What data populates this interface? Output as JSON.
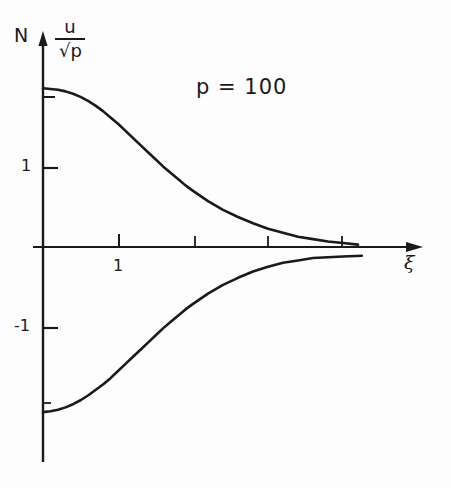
{
  "figure": {
    "background_color": "#fdfdfd",
    "ink_color": "#1a1a1a",
    "corner_marker": "N"
  },
  "annotations": {
    "parameter": "p = 100"
  },
  "axes": {
    "y_label_numerator": "u",
    "y_label_denominator": "p",
    "y_label_radical": "√",
    "y_label_full": "u/√p",
    "x_label": "ξ",
    "y_ticks": [
      {
        "value": 1,
        "label": "1",
        "px_y": 168
      },
      {
        "value": -1,
        "label": "-1",
        "px_y": 328
      }
    ],
    "x_ticks": [
      {
        "value": 1,
        "label": "1",
        "px_x": 119
      },
      {
        "value": 2,
        "label": "",
        "px_x": 195
      },
      {
        "value": 3,
        "label": "",
        "px_x": 268
      },
      {
        "value": 4,
        "label": "",
        "px_x": 342
      }
    ],
    "origin_px": {
      "x": 43,
      "y": 247
    },
    "x_arrow_tip_px": 420,
    "y_arrow_tip_px": 34,
    "px_per_unit_x": 75,
    "px_per_unit_y": 79
  },
  "chart_data": {
    "type": "line",
    "title": "",
    "subtitle": "",
    "xlabel": "ξ",
    "ylabel": "u/√p",
    "xlim": [
      0,
      5.0
    ],
    "ylim": [
      -2.4,
      2.4
    ],
    "grid": false,
    "legend": "none",
    "annotations": [
      {
        "text": "p = 100",
        "x": 2.05,
        "y": 2.05
      },
      {
        "text": "N",
        "x": -0.4,
        "y": 2.55
      }
    ],
    "series": [
      {
        "name": "upper branch",
        "color": "#1a1a1a",
        "x": [
          0.0,
          0.1,
          0.2,
          0.3,
          0.4,
          0.5,
          0.6,
          0.7,
          0.8,
          0.9,
          1.0,
          1.1,
          1.2,
          1.3,
          1.4,
          1.5,
          1.6,
          1.7,
          1.8,
          1.9,
          2.0,
          2.2,
          2.4,
          2.6,
          2.8,
          3.0,
          3.2,
          3.4,
          3.6,
          3.8,
          4.0,
          4.2
        ],
        "y": [
          2.01,
          2.0,
          1.99,
          1.97,
          1.94,
          1.9,
          1.85,
          1.79,
          1.72,
          1.64,
          1.56,
          1.47,
          1.38,
          1.29,
          1.2,
          1.11,
          1.02,
          0.94,
          0.86,
          0.78,
          0.71,
          0.58,
          0.47,
          0.38,
          0.3,
          0.23,
          0.18,
          0.13,
          0.1,
          0.07,
          0.05,
          0.03
        ]
      },
      {
        "name": "lower branch",
        "color": "#1a1a1a",
        "x": [
          0.0,
          0.1,
          0.2,
          0.3,
          0.4,
          0.5,
          0.6,
          0.7,
          0.8,
          0.9,
          1.0,
          1.1,
          1.2,
          1.3,
          1.4,
          1.5,
          1.6,
          1.7,
          1.8,
          1.9,
          2.0,
          2.2,
          2.4,
          2.6,
          2.8,
          3.0,
          3.2,
          3.4,
          3.6,
          3.8,
          4.0,
          4.25
        ],
        "y": [
          -2.09,
          -2.08,
          -2.06,
          -2.03,
          -1.99,
          -1.94,
          -1.88,
          -1.81,
          -1.74,
          -1.66,
          -1.57,
          -1.48,
          -1.39,
          -1.3,
          -1.21,
          -1.12,
          -1.03,
          -0.95,
          -0.87,
          -0.79,
          -0.72,
          -0.59,
          -0.48,
          -0.39,
          -0.31,
          -0.25,
          -0.2,
          -0.17,
          -0.14,
          -0.13,
          -0.12,
          -0.11
        ]
      }
    ]
  }
}
